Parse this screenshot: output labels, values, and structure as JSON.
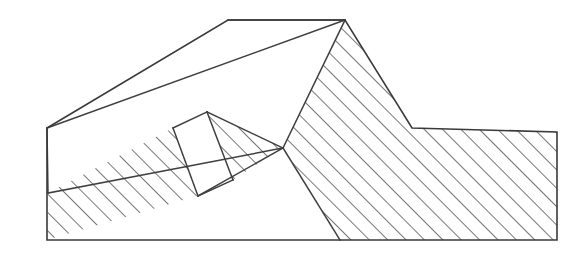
{
  "figure": {
    "type": "line-drawing",
    "width": 587,
    "height": 268,
    "background_color": "#ffffff",
    "line_color": "#3a3a3a",
    "hatch_color": "#4a4a4a",
    "fill_color": "#ffffff"
  },
  "hatching": {
    "angle_degrees": 45,
    "direction": "lower-left to upper-right",
    "spacing_px": 13,
    "stroke_width_px": 1.5,
    "color": "#4a4a4a"
  },
  "geometry": {
    "ground_baseline_y": 240,
    "left_edge_x": 47,
    "right_edge_x": 557,
    "upper_terrace_top_y": 20,
    "lower_terrace_top_y": 132,
    "outer_profile": "47,128 228,20 345,20 412,128 557,132 557,240 47,240",
    "regions": [
      {
        "name": "upper-sliding-slab",
        "fill": "white",
        "points": "47,128 228,20 345,20 207,112 173,128 48,193"
      },
      {
        "name": "hatched-upper-mass",
        "fill": "hatched",
        "points": "345,20 412,128 557,132 557,240 340,240 283,148"
      },
      {
        "name": "hatched-lower-wedge",
        "fill": "hatched",
        "points": "48,193 173,128 207,112 283,148 233,180 198,196 47,240"
      },
      {
        "name": "white-inset-block",
        "fill": "white",
        "points": "173,128 207,112 233,180 198,196"
      },
      {
        "name": "white-triangular-wedge",
        "fill": "white",
        "points": "283,148 340,240 47,240 198,196 233,180"
      }
    ],
    "internal_lines": [
      {
        "name": "slab-base-line",
        "from": "48,193",
        "to": "283,148"
      },
      {
        "name": "slab-top-edge-line",
        "from": "47,128",
        "to": "345,20"
      },
      {
        "name": "fault-plane-line",
        "from": "283,148",
        "to": "345,20"
      },
      {
        "name": "wedge-right-line",
        "from": "283,148",
        "to": "340,240"
      },
      {
        "name": "block-left-line",
        "from": "173,128",
        "to": "198,196"
      },
      {
        "name": "block-right-line",
        "from": "207,112",
        "to": "233,180"
      }
    ]
  }
}
